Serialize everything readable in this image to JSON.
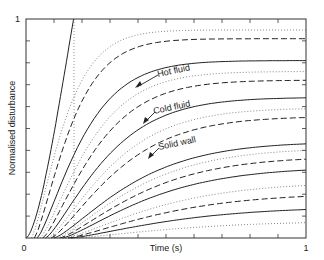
{
  "chart_data": {
    "type": "line",
    "title": "",
    "xlabel": "Time (s)",
    "ylabel": "Normalised disturbance",
    "xlim": [
      0,
      1
    ],
    "ylim": [
      0,
      1
    ],
    "x_tick_labels": [
      "0",
      "1"
    ],
    "y_tick_labels": [
      "0",
      "1"
    ],
    "grid": false,
    "legend": null,
    "line_styles": {
      "hot_fluid": "solid",
      "cold_fluid": "dashed",
      "solid_wall": "dotted"
    },
    "annotations": [
      {
        "text": "Hot fluid",
        "points_to": "solid",
        "x": 0.5,
        "y": 0.62
      },
      {
        "text": "Cold fluid",
        "points_to": "dashed",
        "x": 0.48,
        "y": 0.47
      },
      {
        "text": "Solid wall",
        "points_to": "dotted",
        "x": 0.48,
        "y": 0.34
      }
    ],
    "vertical_reference": {
      "x": 0.17,
      "style": "dotted"
    },
    "series": [
      {
        "name": "Hot fluid 1",
        "style": "solid",
        "onset": 0.0,
        "end_value": 1.0,
        "reaches_one_at": 0.17
      },
      {
        "name": "Solid wall 1",
        "style": "dotted",
        "onset": 0.02,
        "end_value": 0.95
      },
      {
        "name": "Cold fluid 1",
        "style": "dashed",
        "onset": 0.03,
        "end_value": 0.91
      },
      {
        "name": "Hot fluid 2",
        "style": "solid",
        "onset": 0.04,
        "end_value": 0.81
      },
      {
        "name": "Solid wall 2",
        "style": "dotted",
        "onset": 0.05,
        "end_value": 0.76
      },
      {
        "name": "Cold fluid 2",
        "style": "dashed",
        "onset": 0.06,
        "end_value": 0.72
      },
      {
        "name": "Hot fluid 3",
        "style": "solid",
        "onset": 0.07,
        "end_value": 0.64
      },
      {
        "name": "Solid wall 3",
        "style": "dotted",
        "onset": 0.08,
        "end_value": 0.59
      },
      {
        "name": "Cold fluid 3",
        "style": "dashed",
        "onset": 0.09,
        "end_value": 0.55
      },
      {
        "name": "Hot fluid 4",
        "style": "solid",
        "onset": 0.1,
        "end_value": 0.43
      },
      {
        "name": "Solid wall 4",
        "style": "dotted",
        "onset": 0.11,
        "end_value": 0.4
      },
      {
        "name": "Cold fluid 4",
        "style": "dashed",
        "onset": 0.12,
        "end_value": 0.36
      },
      {
        "name": "Hot fluid 5",
        "style": "solid",
        "onset": 0.13,
        "end_value": 0.31
      },
      {
        "name": "Solid wall 5",
        "style": "dotted",
        "onset": 0.14,
        "end_value": 0.24
      },
      {
        "name": "Cold fluid 5",
        "style": "dashed",
        "onset": 0.15,
        "end_value": 0.19
      },
      {
        "name": "Hot fluid 6",
        "style": "solid",
        "onset": 0.16,
        "end_value": 0.13
      },
      {
        "name": "Solid wall 6",
        "style": "dotted",
        "onset": 0.17,
        "end_value": 0.07
      }
    ]
  },
  "labels": {
    "xlabel": "Time (s)",
    "ylabel": "Normalised disturbance",
    "x0": "0",
    "x1": "1",
    "y1": "1",
    "hot": "Hot fluid",
    "cold": "Cold fluid",
    "wall": "Solid wall"
  }
}
